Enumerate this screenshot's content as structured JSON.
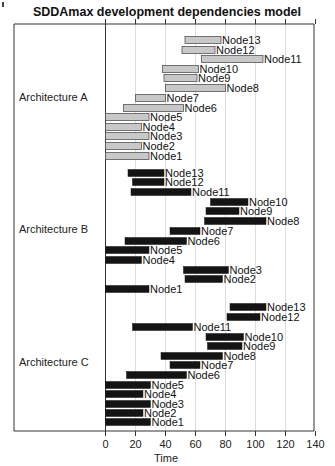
{
  "chart_data": {
    "type": "bar",
    "subtype": "gantt",
    "title": "SDDAmax development dependencies model",
    "xlabel": "Time",
    "ylabel": "",
    "xlim": [
      0,
      140
    ],
    "xticks": [
      0,
      20,
      40,
      60,
      80,
      100,
      120,
      140
    ],
    "grid": true,
    "legend": null,
    "groups": [
      {
        "name": "Architecture A",
        "color": "#c8c8c8",
        "tasks": [
          {
            "name": "Node13",
            "start": 53,
            "end": 77
          },
          {
            "name": "Node12",
            "start": 51,
            "end": 73
          },
          {
            "name": "Node11",
            "start": 64,
            "end": 105
          },
          {
            "name": "Node10",
            "start": 38,
            "end": 62
          },
          {
            "name": "Node9",
            "start": 39,
            "end": 61
          },
          {
            "name": "Node8",
            "start": 40,
            "end": 80
          },
          {
            "name": "Node7",
            "start": 20,
            "end": 40
          },
          {
            "name": "Node6",
            "start": 12,
            "end": 52
          },
          {
            "name": "Node5",
            "start": 0,
            "end": 29
          },
          {
            "name": "Node4",
            "start": 0,
            "end": 24
          },
          {
            "name": "Node3",
            "start": 0,
            "end": 29
          },
          {
            "name": "Node2",
            "start": 0,
            "end": 24
          },
          {
            "name": "Node1",
            "start": 0,
            "end": 29
          }
        ]
      },
      {
        "name": "Architecture B",
        "color": "#222222",
        "tasks": [
          {
            "name": "Node13",
            "start": 15,
            "end": 39
          },
          {
            "name": "Node12",
            "start": 18,
            "end": 39
          },
          {
            "name": "Node11",
            "start": 17,
            "end": 57
          },
          {
            "name": "Node10",
            "start": 70,
            "end": 95
          },
          {
            "name": "Node9",
            "start": 67,
            "end": 89
          },
          {
            "name": "Node8",
            "start": 66,
            "end": 107
          },
          {
            "name": "Node7",
            "start": 43,
            "end": 63
          },
          {
            "name": "Node6",
            "start": 13,
            "end": 54
          },
          {
            "name": "Node5",
            "start": 0,
            "end": 29
          },
          {
            "name": "Node4",
            "start": 0,
            "end": 24
          },
          {
            "name": "Node3",
            "start": 52,
            "end": 82
          },
          {
            "name": "Node2",
            "start": 53,
            "end": 78
          },
          {
            "name": "Node1",
            "start": 0,
            "end": 29
          }
        ]
      },
      {
        "name": "Architecture C",
        "color": "#0a0a0a",
        "tasks": [
          {
            "name": "Node13",
            "start": 83,
            "end": 107
          },
          {
            "name": "Node12",
            "start": 81,
            "end": 103
          },
          {
            "name": "Node11",
            "start": 18,
            "end": 58
          },
          {
            "name": "Node10",
            "start": 67,
            "end": 92
          },
          {
            "name": "Node9",
            "start": 68,
            "end": 91
          },
          {
            "name": "Node8",
            "start": 37,
            "end": 78
          },
          {
            "name": "Node7",
            "start": 43,
            "end": 63
          },
          {
            "name": "Node6",
            "start": 14,
            "end": 54
          },
          {
            "name": "Node5",
            "start": 0,
            "end": 30
          },
          {
            "name": "Node4",
            "start": 0,
            "end": 25
          },
          {
            "name": "Node3",
            "start": 0,
            "end": 30
          },
          {
            "name": "Node2",
            "start": 0,
            "end": 25
          },
          {
            "name": "Node1",
            "start": 0,
            "end": 30
          }
        ]
      }
    ]
  },
  "layout_rows": {
    "A": [
      40,
      50,
      59,
      69,
      78,
      88,
      98,
      108,
      117,
      127,
      136,
      146,
      156
    ],
    "B": [
      173,
      182,
      192,
      202,
      211,
      221,
      231,
      241,
      250,
      260,
      270,
      279,
      289
    ],
    "C": [
      307,
      317,
      327,
      337,
      346,
      356,
      365,
      375,
      385,
      394,
      404,
      413,
      422
    ],
    "group_label_y": [
      101,
      233,
      366
    ]
  },
  "colors": {
    "bar_light_fill": "#c8c8c8",
    "bar_light_stroke": "#555555",
    "bar_dark_fill": "#141414",
    "grid": "#dddddd",
    "axis": "#333333"
  }
}
